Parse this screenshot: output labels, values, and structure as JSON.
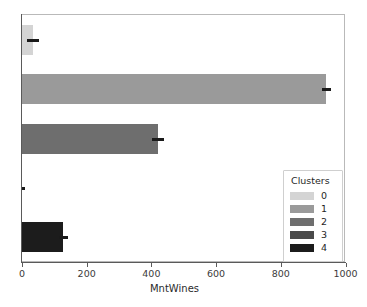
{
  "chart_data": {
    "type": "bar",
    "orientation": "horizontal",
    "title": "",
    "xlabel": "MntWines",
    "ylabel": "",
    "categories": [
      "0",
      "1",
      "2",
      "3",
      "4"
    ],
    "values": [
      35,
      940,
      420,
      0,
      127
    ],
    "errors": [
      18,
      14,
      18,
      0,
      14
    ],
    "xlim": [
      0,
      1000
    ],
    "xticks": [
      0,
      200,
      400,
      600,
      800,
      1000
    ],
    "xticklabels": [
      "0",
      "200",
      "400",
      "600",
      "800",
      "1000"
    ],
    "grid": false,
    "legend_position": "lower-right",
    "series": [
      {
        "name": "0",
        "value": 35,
        "error": 18,
        "color": "#d4d4d4"
      },
      {
        "name": "1",
        "value": 940,
        "error": 14,
        "color": "#9a9a9a"
      },
      {
        "name": "2",
        "value": 420,
        "error": 18,
        "color": "#6e6e6e"
      },
      {
        "name": "3",
        "value": 0,
        "error": 0,
        "color": "#4a4a4a"
      },
      {
        "name": "4",
        "value": 127,
        "error": 14,
        "color": "#1c1c1c"
      }
    ]
  },
  "axis": {
    "xlabel": "MntWines",
    "ticklabels": [
      "0",
      "200",
      "400",
      "600",
      "800",
      "1000"
    ]
  },
  "legend": {
    "title": "Clusters",
    "items": [
      {
        "label": "0",
        "color": "#d4d4d4"
      },
      {
        "label": "1",
        "color": "#9a9a9a"
      },
      {
        "label": "2",
        "color": "#6e6e6e"
      },
      {
        "label": "3",
        "color": "#4a4a4a"
      },
      {
        "label": "4",
        "color": "#1c1c1c"
      }
    ]
  },
  "artifacts": {
    "top": "",
    "bottom": ""
  }
}
